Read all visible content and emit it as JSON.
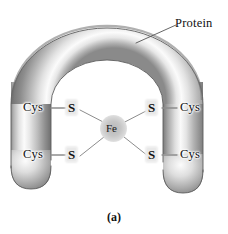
{
  "figure": {
    "caption": "(a)",
    "background_color": "#ffffff",
    "ink_color": "#111111",
    "bond_line_color": "#8a8a8a",
    "leader_line_color": "#555555",
    "tube": {
      "description": "inverted-U shaded gray protein backbone tube",
      "highlight_color": "#ffffff",
      "mid_color": "#c8c8c8",
      "shadow_color": "#6d6d6d",
      "outline_color": "#4a4a4a"
    },
    "metal_center": {
      "label": "Fe",
      "halo_color": "#c6c6c6"
    },
    "labels": {
      "protein": "Protein",
      "cys_top_left": "Cys",
      "cys_bottom_left": "Cys",
      "cys_top_right": "Cys",
      "cys_bottom_right": "Cys",
      "s_top_left": "S",
      "s_bottom_left": "S",
      "s_top_right": "S",
      "s_bottom_right": "S"
    }
  }
}
